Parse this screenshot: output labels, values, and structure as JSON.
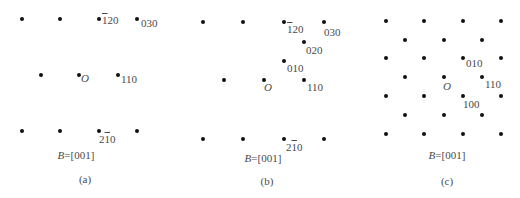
{
  "figure": {
    "panels": [
      {
        "id": "a",
        "caption": "(a)",
        "zone_axis_prefix": "B",
        "zone_axis_value": "=[001]",
        "origin_label": "O",
        "spots": [
          {
            "x": 22,
            "y": 19
          },
          {
            "x": 60,
            "y": 19
          },
          {
            "x": 99,
            "y": 19
          },
          {
            "x": 137,
            "y": 19
          },
          {
            "x": 41,
            "y": 75
          },
          {
            "x": 79,
            "y": 75
          },
          {
            "x": 118,
            "y": 75
          },
          {
            "x": 22,
            "y": 131
          },
          {
            "x": 60,
            "y": 131
          },
          {
            "x": 99,
            "y": 131
          },
          {
            "x": 137,
            "y": 131
          }
        ],
        "labels": [
          {
            "text": "1",
            "bar": true,
            "rest": "20",
            "x": 102,
            "y": 18
          },
          {
            "text": "030",
            "x": 141,
            "y": 20
          },
          {
            "text": "110",
            "x": 121,
            "y": 76
          },
          {
            "text": "2",
            "rest2": "10",
            "bar2": "1",
            "x": 99,
            "y": 135
          }
        ]
      },
      {
        "id": "b",
        "caption": "(b)",
        "zone_axis_prefix": "B",
        "zone_axis_value": "=[001]",
        "origin_label": "O",
        "spots": [
          {
            "x": 203,
            "y": 22
          },
          {
            "x": 243,
            "y": 22
          },
          {
            "x": 284,
            "y": 22
          },
          {
            "x": 324,
            "y": 22
          },
          {
            "x": 304,
            "y": 42
          },
          {
            "x": 284,
            "y": 61
          },
          {
            "x": 224,
            "y": 80
          },
          {
            "x": 264,
            "y": 80
          },
          {
            "x": 304,
            "y": 80
          },
          {
            "x": 203,
            "y": 139
          },
          {
            "x": 243,
            "y": 139
          },
          {
            "x": 284,
            "y": 139
          },
          {
            "x": 324,
            "y": 139
          }
        ]
      },
      {
        "id": "c",
        "caption": "(c)",
        "zone_axis_prefix": "B",
        "zone_axis_value": "=[001]",
        "origin_label": "O"
      }
    ],
    "labels_text": {
      "a_120": "120",
      "a_030": "030",
      "a_110": "110",
      "a_210": "210",
      "b_120": "120",
      "b_030": "030",
      "b_020": "020",
      "b_010": "010",
      "b_110": "110",
      "b_210": "210",
      "c_010": "010",
      "c_110": "110",
      "c_100": "100"
    },
    "captions": {
      "a": "(a)",
      "b": "(b)",
      "c": "(c)"
    },
    "zone_axis": {
      "prefix": "B",
      "value": "=[001]"
    },
    "origin": "O",
    "overline_digits": {
      "neg_1": "1",
      "neg_1b": "1"
    }
  }
}
